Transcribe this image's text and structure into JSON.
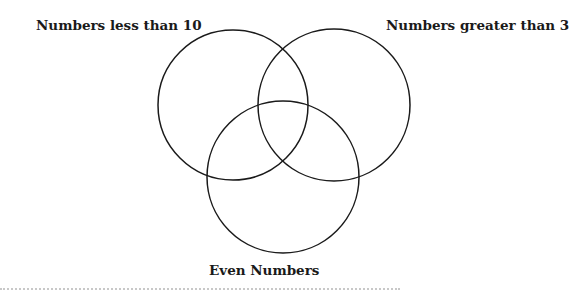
{
  "diagram": {
    "type": "venn",
    "sets": [
      {
        "id": "A",
        "label": "Numbers less than 10",
        "cx": 233,
        "cy": 105,
        "r": 75
      },
      {
        "id": "B",
        "label": "Numbers greater than 3",
        "cx": 334,
        "cy": 105,
        "r": 76
      },
      {
        "id": "C",
        "label": "Even Numbers",
        "cx": 283,
        "cy": 177,
        "r": 76
      }
    ],
    "stroke_color": "#1a1a1a"
  }
}
